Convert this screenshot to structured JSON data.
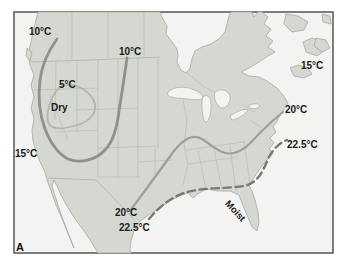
{
  "figure": {
    "panel_label": "A",
    "kind": "isotherm-climate-map",
    "region": "North America"
  },
  "map": {
    "annotations": {
      "dry": "Dry",
      "moist": "Moist"
    },
    "isotherm_labels": {
      "c10_northwest": "10°C",
      "c10_central": "10°C",
      "c5_basin": "5°C",
      "c15_pacific": "15°C",
      "c15_atlantic": "15°C",
      "c20_texas": "20°C",
      "c20_mid_atlantic": "20°C",
      "c22_5_gulf": "22.5°C",
      "c22_5_atlantic": "22.5°C"
    },
    "isotherms": [
      {
        "value_c": 10,
        "label": "10°C",
        "style": "solid",
        "position": "northwest-to-plains U-shaped curve"
      },
      {
        "value_c": 5,
        "label": "5°C",
        "style": "solid",
        "position": "closed loop around Dry basin"
      },
      {
        "value_c": 15,
        "label": "15°C",
        "style": "label",
        "position": "pacific-coast"
      },
      {
        "value_c": 15,
        "label": "15°C",
        "style": "label",
        "position": "atlantic-northeast"
      },
      {
        "value_c": 20,
        "label": "20°C",
        "style": "solid",
        "position": "texas-to-mid-atlantic"
      },
      {
        "value_c": 22.5,
        "label": "22.5°C",
        "style": "dashed",
        "position": "gulf-coast-to-atlantic"
      }
    ]
  },
  "colors": {
    "land": "#d5d8d1",
    "ocean": "#f3f4f1",
    "frame": "#5f5f5f",
    "coastline": "#a6a99f",
    "state_border": "#b9bcb4",
    "isotherm_major": "#8f928c",
    "isotherm_secondary": "#9da09a",
    "isotherm_light": "#b3b6ae",
    "isotherm_dashed": "#767a74",
    "text": "#1a1a1a"
  }
}
